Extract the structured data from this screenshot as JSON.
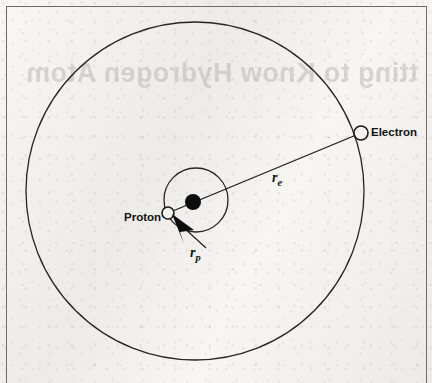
{
  "figure": {
    "type": "physics-diagram",
    "background_color": "#efedea",
    "ink_color": "#1a1a1a",
    "frame": {
      "color": "#6e6c6a",
      "sides": "left-top-right",
      "x": 6,
      "y": 6,
      "width": 419,
      "height": 377
    },
    "showthrough_text": "tting to Know Hydrogen Atom"
  },
  "labels": {
    "electron": "Electron",
    "proton": "Proton",
    "r_e_symbol": "r",
    "r_e_subscript": "e",
    "r_p_symbol": "r",
    "r_p_subscript": "p"
  },
  "geometry": {
    "electron_orbit": {
      "name": "electron-orbit-circle",
      "cx": 195,
      "cy": 191,
      "r": 169,
      "stroke": "#262626",
      "stroke_width": 1.3,
      "fill": "none"
    },
    "proton_orbit": {
      "name": "proton-orbit-circle",
      "cx": 196,
      "cy": 200,
      "r": 32,
      "stroke": "#262626",
      "stroke_width": 1.3,
      "fill": "none"
    },
    "center_of_mass": {
      "name": "center-of-mass-dot",
      "cx": 193,
      "cy": 202,
      "r": 8,
      "fill": "#0d0d0d"
    },
    "electron_particle": {
      "name": "electron-particle",
      "cx": 361,
      "cy": 133,
      "r": 7,
      "fill": "#f4f2ef",
      "stroke": "#1a1a1a",
      "stroke_width": 1.5
    },
    "proton_particle": {
      "name": "proton-particle",
      "cx": 168,
      "cy": 213,
      "r": 6,
      "fill": "#f4f2ef",
      "stroke": "#1a1a1a",
      "stroke_width": 1.5
    },
    "radius_line_electron": {
      "name": "electron-radius-line",
      "x1": 168,
      "y1": 213,
      "x2": 361,
      "y2": 133,
      "stroke": "#1a1a1a",
      "stroke_width": 1.3
    },
    "leader_line_rp": {
      "name": "rp-leader-line",
      "x1": 207,
      "y1": 249,
      "x2": 180,
      "y2": 224,
      "stroke": "#1a1a1a",
      "stroke_width": 1.1
    },
    "arrow_head_rp": {
      "name": "rp-arrowhead",
      "points": "171,215 192,228 179,232 183,243",
      "fill": "#0d0d0d"
    }
  },
  "label_positions": {
    "electron": {
      "x": 371,
      "y": 126
    },
    "proton": {
      "x": 124,
      "y": 211
    },
    "r_e": {
      "x": 272,
      "y": 171
    },
    "r_p": {
      "x": 190,
      "y": 245
    }
  }
}
